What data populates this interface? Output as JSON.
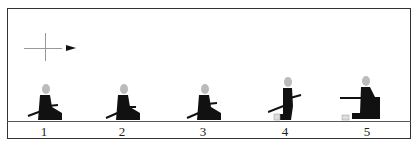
{
  "diagram": {
    "title": "",
    "direction_indicator": "crosshair-with-arrow-right",
    "poses": [
      {
        "label": "1",
        "x": 44
      },
      {
        "label": "2",
        "x": 122
      },
      {
        "label": "3",
        "x": 203
      },
      {
        "label": "4",
        "x": 285
      },
      {
        "label": "5",
        "x": 365
      }
    ]
  }
}
